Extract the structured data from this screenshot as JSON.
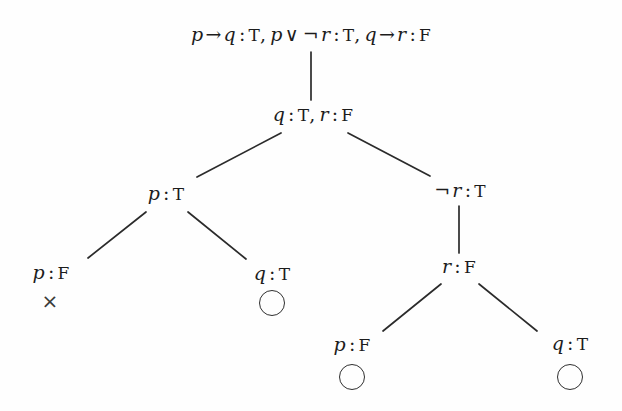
{
  "figure": {
    "width": 622,
    "height": 411,
    "background": "#fefefe",
    "ink_color": "#1c1c1c",
    "edge_color": "#2b2b2b"
  },
  "nodes": [
    {
      "id": "root",
      "text": "p → q : T, p ∨ ¬r : T, q → r : F",
      "x": 311,
      "y": 34,
      "parts": [
        {
          "kind": "var",
          "t": "p"
        },
        {
          "kind": "op",
          "t": "→"
        },
        {
          "kind": "var",
          "t": "q"
        },
        {
          "kind": "colon",
          "t": ":"
        },
        {
          "kind": "val",
          "t": "T"
        },
        {
          "kind": "comma",
          "t": ","
        },
        {
          "kind": "var",
          "t": "p"
        },
        {
          "kind": "op",
          "t": "∨"
        },
        {
          "kind": "op",
          "t": "¬"
        },
        {
          "kind": "var",
          "t": "r"
        },
        {
          "kind": "colon",
          "t": ":"
        },
        {
          "kind": "val",
          "t": "T"
        },
        {
          "kind": "comma",
          "t": ","
        },
        {
          "kind": "var",
          "t": "q"
        },
        {
          "kind": "op",
          "t": "→"
        },
        {
          "kind": "var",
          "t": "r"
        },
        {
          "kind": "colon",
          "t": ":"
        },
        {
          "kind": "val",
          "t": "F"
        }
      ]
    },
    {
      "id": "level2",
      "text": "q : T, r : F",
      "x": 313,
      "y": 114,
      "parts": [
        {
          "kind": "var",
          "t": "q"
        },
        {
          "kind": "colon",
          "t": ":"
        },
        {
          "kind": "val",
          "t": "T"
        },
        {
          "kind": "comma",
          "t": ","
        },
        {
          "kind": "var",
          "t": "r"
        },
        {
          "kind": "colon",
          "t": ":"
        },
        {
          "kind": "val",
          "t": "F"
        }
      ]
    },
    {
      "id": "left-pT",
      "text": "p : T",
      "x": 166,
      "y": 193,
      "parts": [
        {
          "kind": "var",
          "t": "p"
        },
        {
          "kind": "colon",
          "t": ":"
        },
        {
          "kind": "val",
          "t": "T"
        }
      ]
    },
    {
      "id": "right-notr",
      "text": "¬r : T",
      "x": 459,
      "y": 190,
      "parts": [
        {
          "kind": "op",
          "t": "¬"
        },
        {
          "kind": "var",
          "t": "r"
        },
        {
          "kind": "colon",
          "t": ":"
        },
        {
          "kind": "val",
          "t": "T"
        }
      ]
    },
    {
      "id": "leaf-pF-left",
      "text": "p : F",
      "x": 51,
      "y": 272,
      "parts": [
        {
          "kind": "var",
          "t": "p"
        },
        {
          "kind": "colon",
          "t": ":"
        },
        {
          "kind": "val",
          "t": "F"
        }
      ]
    },
    {
      "id": "leaf-qT-mid",
      "text": "q : T",
      "x": 272,
      "y": 273,
      "parts": [
        {
          "kind": "var",
          "t": "q"
        },
        {
          "kind": "colon",
          "t": ":"
        },
        {
          "kind": "val",
          "t": "T"
        }
      ]
    },
    {
      "id": "node-rF",
      "text": "r : F",
      "x": 459,
      "y": 266,
      "parts": [
        {
          "kind": "var",
          "t": "r"
        },
        {
          "kind": "colon",
          "t": ":"
        },
        {
          "kind": "val",
          "t": "F"
        }
      ]
    },
    {
      "id": "leaf-pF-bottom",
      "text": "p : F",
      "x": 352,
      "y": 344,
      "parts": [
        {
          "kind": "var",
          "t": "p"
        },
        {
          "kind": "colon",
          "t": ":"
        },
        {
          "kind": "val",
          "t": "F"
        }
      ]
    },
    {
      "id": "leaf-qT-bottom",
      "text": "q : T",
      "x": 570,
      "y": 343,
      "parts": [
        {
          "kind": "var",
          "t": "q"
        },
        {
          "kind": "colon",
          "t": ":"
        },
        {
          "kind": "val",
          "t": "T"
        }
      ]
    }
  ],
  "edges": [
    {
      "id": "root-to-level2",
      "x1": 311,
      "y1": 52,
      "x2": 311,
      "y2": 100
    },
    {
      "id": "level2-to-pT",
      "x1": 281,
      "y1": 133,
      "x2": 197,
      "y2": 177
    },
    {
      "id": "level2-to-notr",
      "x1": 348,
      "y1": 133,
      "x2": 430,
      "y2": 176
    },
    {
      "id": "pT-to-pF",
      "x1": 146,
      "y1": 212,
      "x2": 88,
      "y2": 258
    },
    {
      "id": "pT-to-qT",
      "x1": 188,
      "y1": 212,
      "x2": 246,
      "y2": 259
    },
    {
      "id": "notr-to-rF",
      "x1": 459,
      "y1": 206,
      "x2": 459,
      "y2": 253
    },
    {
      "id": "rF-to-pF",
      "x1": 441,
      "y1": 284,
      "x2": 383,
      "y2": 331
    },
    {
      "id": "rF-to-qT",
      "x1": 479,
      "y1": 284,
      "x2": 537,
      "y2": 331
    }
  ],
  "markers": [
    {
      "id": "closed-left",
      "type": "closed",
      "glyph": "×",
      "x": 50,
      "y": 301,
      "meaning": "branch-closed"
    },
    {
      "id": "open-mid",
      "type": "open",
      "glyph": "○",
      "x": 272,
      "y": 303,
      "meaning": "branch-open"
    },
    {
      "id": "open-bottom-left",
      "type": "open",
      "glyph": "○",
      "x": 352,
      "y": 377,
      "meaning": "branch-open"
    },
    {
      "id": "open-bottom-right",
      "type": "open",
      "glyph": "○",
      "x": 570,
      "y": 377,
      "meaning": "branch-open"
    }
  ]
}
